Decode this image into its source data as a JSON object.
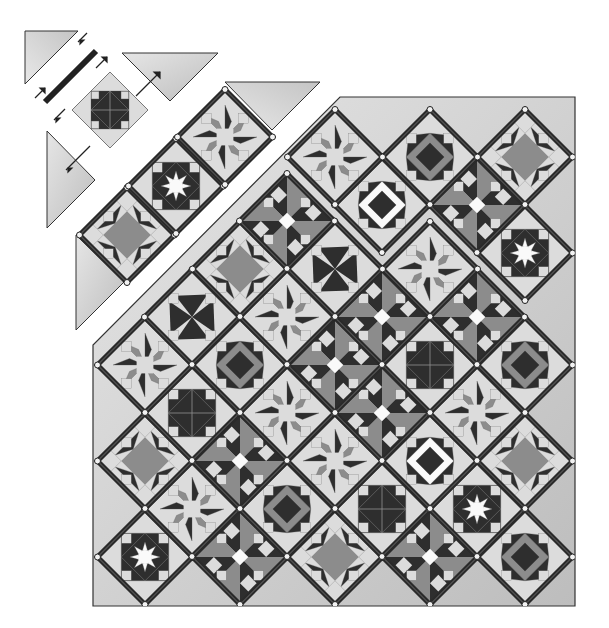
{
  "diagram": {
    "title": "",
    "colors": {
      "background": "#ffffff",
      "setting_triangle": "#d4d4d4",
      "setting_triangle_dark": "#b8b8b8",
      "sashing": "#2a2a2a",
      "sashing_highlight": "#6a6a6a",
      "cornerstone": "#f2f2f2",
      "block_light": "#dcdcdc",
      "block_mid": "#8c8c8c",
      "block_dark": "#2e2e2e",
      "block_white": "#fafafa",
      "outline": "#333333"
    },
    "main_quilt": {
      "left": 93,
      "top": 97,
      "right": 575,
      "bottom": 606,
      "pitch": 95,
      "blocks": [
        {
          "cx": 145,
          "cy": 557,
          "pattern": "star8"
        },
        {
          "cx": 240,
          "cy": 557,
          "pattern": "pinwheel"
        },
        {
          "cx": 335,
          "cy": 557,
          "pattern": "ohio"
        },
        {
          "cx": 430,
          "cy": 557,
          "pattern": "pinwheel"
        },
        {
          "cx": 525,
          "cy": 557,
          "pattern": "square"
        },
        {
          "cx": 192,
          "cy": 509,
          "pattern": "lemoyne"
        },
        {
          "cx": 287,
          "cy": 509,
          "pattern": "square"
        },
        {
          "cx": 382,
          "cy": 509,
          "pattern": "star_dark"
        },
        {
          "cx": 477,
          "cy": 509,
          "pattern": "star8"
        },
        {
          "cx": 145,
          "cy": 461,
          "pattern": "ohio"
        },
        {
          "cx": 240,
          "cy": 461,
          "pattern": "pinwheel"
        },
        {
          "cx": 335,
          "cy": 461,
          "pattern": "lemoyne"
        },
        {
          "cx": 430,
          "cy": 461,
          "pattern": "window"
        },
        {
          "cx": 525,
          "cy": 461,
          "pattern": "ohio"
        },
        {
          "cx": 192,
          "cy": 413,
          "pattern": "star_dark"
        },
        {
          "cx": 287,
          "cy": 413,
          "pattern": "lemoyne"
        },
        {
          "cx": 382,
          "cy": 413,
          "pattern": "pinwheel"
        },
        {
          "cx": 477,
          "cy": 413,
          "pattern": "lemoyne"
        },
        {
          "cx": 145,
          "cy": 365,
          "pattern": "lemoyne"
        },
        {
          "cx": 240,
          "cy": 365,
          "pattern": "square"
        },
        {
          "cx": 335,
          "cy": 365,
          "pattern": "pinwheel"
        },
        {
          "cx": 430,
          "cy": 365,
          "pattern": "star_dark"
        },
        {
          "cx": 525,
          "cy": 365,
          "pattern": "square"
        },
        {
          "cx": 192,
          "cy": 317,
          "pattern": "whirl"
        },
        {
          "cx": 287,
          "cy": 317,
          "pattern": "lemoyne"
        },
        {
          "cx": 382,
          "cy": 317,
          "pattern": "pinwheel"
        },
        {
          "cx": 477,
          "cy": 317,
          "pattern": "pinwheel"
        },
        {
          "cx": 240,
          "cy": 269,
          "pattern": "ohio"
        },
        {
          "cx": 335,
          "cy": 269,
          "pattern": "whirl"
        },
        {
          "cx": 430,
          "cy": 269,
          "pattern": "lemoyne"
        },
        {
          "cx": 525,
          "cy": 253,
          "pattern": "star8"
        },
        {
          "cx": 287,
          "cy": 221,
          "pattern": "pinwheel"
        },
        {
          "cx": 382,
          "cy": 205,
          "pattern": "window"
        },
        {
          "cx": 477,
          "cy": 205,
          "pattern": "pinwheel"
        },
        {
          "cx": 335,
          "cy": 157,
          "pattern": "lemoyne"
        },
        {
          "cx": 430,
          "cy": 157,
          "pattern": "square"
        },
        {
          "cx": 525,
          "cy": 157,
          "pattern": "ohio"
        }
      ]
    },
    "detached_row": {
      "blocks": [
        {
          "cx": 127,
          "cy": 235,
          "pattern": "ohio"
        },
        {
          "cx": 176,
          "cy": 186,
          "pattern": "star8"
        },
        {
          "cx": 225,
          "cy": 137,
          "pattern": "lemoyne"
        }
      ]
    },
    "exploded_block": {
      "cx": 110,
      "cy": 110,
      "pattern": "star_dark"
    }
  }
}
